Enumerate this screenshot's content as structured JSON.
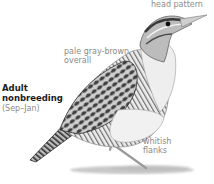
{
  "figure": {
    "title_line1": "Adult",
    "title_line2": "nonbreeding",
    "season": "(Sep–Jan)",
    "labels": {
      "head": "head pattern",
      "overall_line1": "pale gray-brown",
      "overall_line2": "overall",
      "flanks_line1": "whitish",
      "flanks_line2": "flanks"
    },
    "colors": {
      "label_text": "#8a8a8a",
      "title_text": "#1a1a1a",
      "bird_dark": "#3a3a3a",
      "bird_mid": "#8c8c8c",
      "bird_light": "#d9d9d9",
      "background": "#ffffff"
    }
  }
}
